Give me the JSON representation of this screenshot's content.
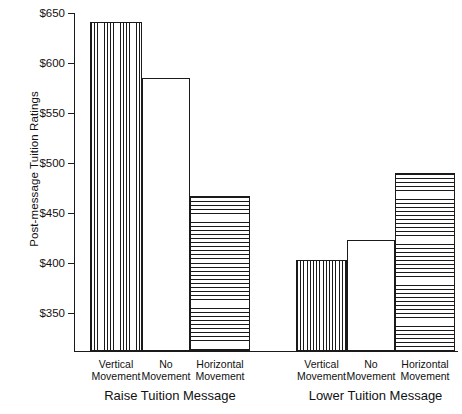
{
  "chart_data": {
    "type": "bar",
    "title": "",
    "xlabel": "",
    "ylabel": "Post-message Tuition Ratings",
    "ylim": [
      330,
      655
    ],
    "grid": false,
    "legend": "none",
    "ytick_labels": [
      "$650",
      "$600",
      "$550",
      "$500",
      "$450",
      "$400",
      "$350"
    ],
    "ytick_values": [
      650,
      600,
      550,
      500,
      450,
      400,
      350
    ],
    "groups": [
      {
        "label": "Raise Tuition Message",
        "categories": [
          "Vertical Movement",
          "No Movement",
          "Horizontal Movement"
        ],
        "values": [
          641,
          585,
          467
        ]
      },
      {
        "label": "Lower Tuition Message",
        "categories": [
          "Vertical Movement",
          "No Movement",
          "Horizontal Movement"
        ],
        "values": [
          403,
          423,
          490
        ]
      }
    ],
    "categories": [
      "Vertical Movement",
      "No Movement",
      "Horizontal Movement"
    ],
    "series": [
      {
        "name": "Raise Tuition Message",
        "values": [
          641,
          585,
          467
        ]
      },
      {
        "name": "Lower Tuition Message",
        "values": [
          403,
          423,
          490
        ]
      }
    ],
    "bars": [
      {
        "group": "Raise Tuition Message",
        "category": "Vertical Movement",
        "value": 641,
        "pattern": "vertical",
        "line1": "Vertical",
        "line2": "Movement"
      },
      {
        "group": "Raise Tuition Message",
        "category": "No Movement",
        "value": 585,
        "pattern": "none",
        "line1": "No",
        "line2": "Movement"
      },
      {
        "group": "Raise Tuition Message",
        "category": "Horizontal Movement",
        "value": 467,
        "pattern": "horizontal",
        "line1": "Horizontal",
        "line2": "Movement"
      },
      {
        "group": "Lower Tuition Message",
        "category": "Vertical Movement",
        "value": 403,
        "pattern": "vertical",
        "line1": "Vertical",
        "line2": "Movement"
      },
      {
        "group": "Lower Tuition Message",
        "category": "No Movement",
        "value": 423,
        "pattern": "none",
        "line1": "No",
        "line2": "Movement"
      },
      {
        "group": "Lower Tuition Message",
        "category": "Horizontal Movement",
        "value": 490,
        "pattern": "horizontal",
        "line1": "Horizontal",
        "line2": "Movement"
      }
    ],
    "colors": {
      "axis": "#1a1a1a",
      "bar_outline": "#1a1a1a",
      "bar_fill": "#ffffff",
      "hatch": "#1a1a1a",
      "background": "#ffffff",
      "text": "#111111"
    },
    "geometry": {
      "bar_left_px": [
        16,
        68,
        116,
        222,
        273,
        321
      ],
      "bar_width_px": [
        52,
        48,
        60,
        51,
        48,
        60
      ]
    }
  }
}
